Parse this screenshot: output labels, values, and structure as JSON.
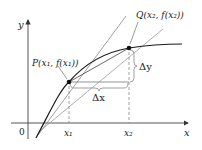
{
  "diagram": {
    "type": "secant-tangent",
    "axes": {
      "x_label": "x",
      "y_label": "y",
      "origin_label": "0",
      "x_ticks": [
        "x₁",
        "x₂"
      ]
    },
    "points": {
      "P": {
        "label": "P(x₁, f(x₁))"
      },
      "Q": {
        "label": "Q(x₂, f(x₂))"
      }
    },
    "increments": {
      "dx_label": "Δx",
      "dy_label": "Δy"
    },
    "colors": {
      "curve": "#1a1a1a",
      "secant": "#333333",
      "tangent": "#8a8a8a",
      "axis": "#444444",
      "guide": "#777777"
    }
  }
}
